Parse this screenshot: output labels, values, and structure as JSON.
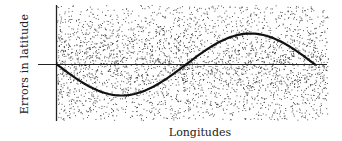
{
  "chart_data": {
    "type": "line",
    "title": "",
    "xlabel": "Longitudes",
    "ylabel": "Errors in latitude",
    "grid": false,
    "legend": null,
    "background": "stippled (dot texture), denser near the zero line",
    "axes": {
      "y_axis_visible": true,
      "zero_line_visible": true,
      "ticks": "none"
    },
    "xlim": [
      0,
      360
    ],
    "ylim": [
      -1.4,
      1.4
    ],
    "series": [
      {
        "name": "Latitude error",
        "shape": "one full sine-like cycle starting at zero going negative first",
        "x": [
          0,
          45,
          90,
          135,
          180,
          225,
          270,
          315,
          360
        ],
        "values": [
          0,
          -0.7,
          -1.0,
          -0.7,
          0,
          0.7,
          1.0,
          0.7,
          0
        ],
        "color": "#111111"
      }
    ]
  },
  "labels": {
    "ylabel": "Errors in latitude",
    "xlabel": "Longitudes"
  },
  "colors": {
    "ink": "#111111",
    "stipple": "#333333",
    "background": "#ffffff"
  }
}
